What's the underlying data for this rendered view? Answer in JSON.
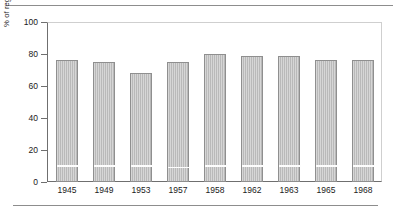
{
  "chart_data": {
    "type": "bar",
    "title": "",
    "subtitle": "",
    "xlabel": "",
    "ylabel": "% of registered voters who voted",
    "categories": [
      "1945",
      "1949",
      "1953",
      "1957",
      "1958",
      "1962",
      "1963",
      "1965",
      "1968"
    ],
    "values": [
      76,
      75,
      68,
      75,
      80,
      79,
      79,
      76,
      76
    ],
    "segment_marker_values": [
      9,
      9,
      9,
      8,
      9,
      9,
      9,
      9,
      9
    ],
    "ylim": [
      0,
      100
    ],
    "yticks": [
      0,
      20,
      40,
      60,
      80,
      100
    ],
    "ytick_labels": [
      "0",
      "20",
      "40",
      "60",
      "80",
      "100"
    ],
    "grid": false,
    "legend": "none",
    "bar_color": "#b9b9b9",
    "bar_edge_color": "#8f8f8f",
    "axis_color": "#6f6f6f",
    "frame_color": "#cfcfcf",
    "divider_color": "#fdfdfd",
    "rule_color": "#8d8d8d"
  }
}
